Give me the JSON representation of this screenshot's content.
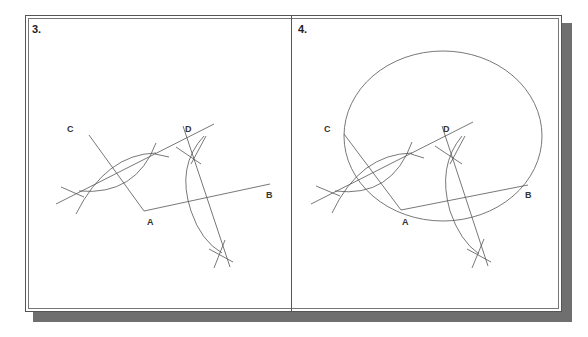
{
  "figure": {
    "panels": [
      {
        "step": "3.",
        "labels": {
          "C": "C",
          "D": "D",
          "A": "A",
          "B": "B"
        }
      },
      {
        "step": "4.",
        "labels": {
          "C": "C",
          "D": "D",
          "A": "A",
          "B": "B"
        }
      }
    ],
    "colors": {
      "line": "#555555",
      "frame": "#555555",
      "shadow": "#6f6f6f",
      "background": "#ffffff"
    }
  }
}
